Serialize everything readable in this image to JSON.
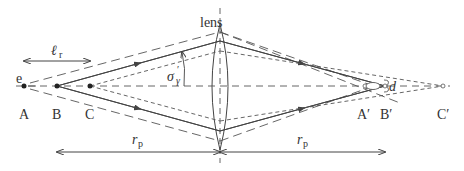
{
  "diagram": {
    "labels": {
      "lens": "lens",
      "e": "e",
      "A": "A",
      "B": "B",
      "C": "C",
      "A_prime": "A′",
      "B_prime": "B′",
      "C_prime": "C′",
      "l_r": "ℓ",
      "l_r_sub": "r",
      "sigma": "σ",
      "sigma_sub": "γ",
      "sigma_sup": "′",
      "d": "d",
      "r_p_left": "r",
      "r_p_left_sub": "p",
      "r_p_right": "r",
      "r_p_right_sub": "p"
    },
    "colors": {
      "line": "#444444",
      "background": "#ffffff"
    }
  }
}
